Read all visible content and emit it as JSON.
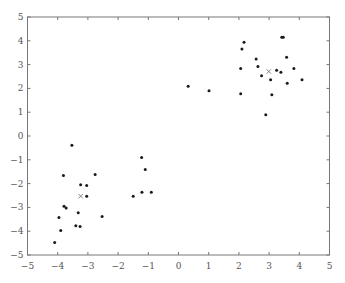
{
  "chart_data": {
    "type": "scatter",
    "title": "",
    "xlabel": "",
    "ylabel": "",
    "xlim": [
      -5,
      5
    ],
    "ylim": [
      -5,
      5
    ],
    "grid": false,
    "legend": null,
    "x_ticks": [
      -5,
      -4,
      -3,
      -2,
      -1,
      0,
      1,
      2,
      3,
      4,
      5
    ],
    "y_ticks": [
      -5,
      -4,
      -3,
      -2,
      -1,
      0,
      1,
      2,
      3,
      4,
      5
    ],
    "x_tick_labels": [
      "−5",
      "−4",
      "−3",
      "−2",
      "−1",
      "0",
      "1",
      "2",
      "3",
      "4",
      "5"
    ],
    "y_tick_labels": [
      "−5",
      "−4",
      "−3",
      "−2",
      "−1",
      "0",
      "1",
      "2",
      "3",
      "4",
      "5"
    ],
    "series": [
      {
        "name": "data points",
        "marker": "dot",
        "color": "#1a1a1a",
        "points": [
          [
            -3.53,
            -0.39
          ],
          [
            -3.81,
            -1.66
          ],
          [
            -2.76,
            -1.62
          ],
          [
            -3.24,
            -2.05
          ],
          [
            -3.04,
            -2.08
          ],
          [
            -3.04,
            -2.53
          ],
          [
            -3.79,
            -2.95
          ],
          [
            -3.72,
            -3.02
          ],
          [
            -3.32,
            -3.23
          ],
          [
            -3.96,
            -3.42
          ],
          [
            -2.53,
            -3.38
          ],
          [
            -3.4,
            -3.77
          ],
          [
            -3.26,
            -3.8
          ],
          [
            -3.9,
            -3.97
          ],
          [
            -4.1,
            -4.47
          ],
          [
            -1.22,
            -0.9
          ],
          [
            -1.1,
            -1.41
          ],
          [
            -1.21,
            -2.36
          ],
          [
            -0.9,
            -2.36
          ],
          [
            -1.5,
            -2.53
          ],
          [
            0.32,
            2.09
          ],
          [
            1.01,
            1.9
          ],
          [
            2.17,
            3.94
          ],
          [
            2.1,
            3.66
          ],
          [
            3.42,
            4.15
          ],
          [
            3.47,
            4.15
          ],
          [
            2.57,
            3.24
          ],
          [
            3.58,
            3.31
          ],
          [
            2.06,
            2.84
          ],
          [
            2.63,
            2.92
          ],
          [
            3.82,
            2.84
          ],
          [
            3.25,
            2.76
          ],
          [
            3.39,
            2.68
          ],
          [
            2.75,
            2.53
          ],
          [
            3.05,
            2.36
          ],
          [
            4.09,
            2.36
          ],
          [
            3.6,
            2.22
          ],
          [
            2.06,
            1.77
          ],
          [
            3.09,
            1.73
          ],
          [
            2.89,
            0.89
          ]
        ]
      },
      {
        "name": "cluster centroids",
        "marker": "x",
        "color": "#777777",
        "points": [
          [
            -3.24,
            -2.53
          ],
          [
            2.99,
            2.71
          ]
        ]
      }
    ]
  }
}
